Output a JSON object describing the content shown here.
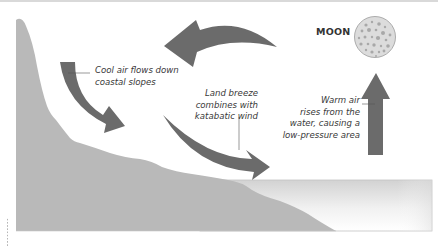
{
  "diagram": {
    "moon": {
      "label": "MOON"
    },
    "labels": {
      "cool_air": [
        "Cool air flows down",
        "coastal slopes"
      ],
      "land_breeze": [
        "Land breeze",
        "combines with",
        "katabatic wind"
      ],
      "warm_air": [
        "Warm air",
        "rises from the",
        "water, causing a",
        "low-pressure area"
      ]
    },
    "colors": {
      "arrow": "#6b6b6b",
      "land": "#b9b9b9",
      "water_top": "#d4d4d4",
      "water_bottom": "#ffffff",
      "moon_fill": "#dcdcdc",
      "moon_spots": "#a8a8a8",
      "leader_line": "#555555"
    }
  }
}
